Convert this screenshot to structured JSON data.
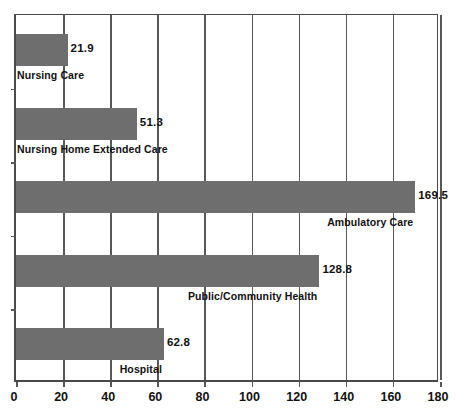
{
  "chart_data": {
    "type": "bar",
    "orientation": "horizontal",
    "title": "",
    "subtitle": "",
    "xlabel": "",
    "ylabel": "",
    "xlim": [
      0,
      180
    ],
    "xticks": [
      0,
      20,
      40,
      60,
      80,
      100,
      120,
      140,
      160,
      180
    ],
    "xtick_labels": [
      "0",
      "20",
      "40",
      "60",
      "80",
      "100",
      "120",
      "140",
      "160",
      "180"
    ],
    "grid": true,
    "grid_axis": "x",
    "legend": false,
    "legend_position": "none",
    "bar_color": "#6e6e6e",
    "axis_color": "#4a4a4a",
    "gridline_color": "#585858",
    "text_color": "#111111",
    "background": "#ffffff",
    "categories": [
      "Nursing Care",
      "Nursing Home Extended Care",
      "Ambulatory Care",
      "Public/Community Health",
      "Hospital"
    ],
    "values": [
      21.9,
      51.3,
      169.5,
      128.8,
      62.8
    ],
    "value_labels": [
      "21.9",
      "51.3",
      "169.5",
      "128.8",
      "62.8"
    ],
    "bars": [
      {
        "category": "Nursing Care",
        "value": 21.9,
        "value_label": "21.9",
        "category_label": "Nursing Care",
        "label_align": "left"
      },
      {
        "category": "Nursing Home Extended Care",
        "value": 51.3,
        "value_label": "51.3",
        "category_label": "Nursing Home Extended Care",
        "label_align": "left"
      },
      {
        "category": "Ambulatory Care",
        "value": 169.5,
        "value_label": "169.5",
        "category_label": "Ambulatory Care",
        "label_align": "right"
      },
      {
        "category": "Public/Community Health",
        "value": 128.8,
        "value_label": "128.8",
        "category_label": "Public/Community Health",
        "label_align": "right"
      },
      {
        "category": "Hospital",
        "value": 62.8,
        "value_label": "62.8",
        "category_label": "Hospital",
        "label_align": "right"
      }
    ]
  }
}
